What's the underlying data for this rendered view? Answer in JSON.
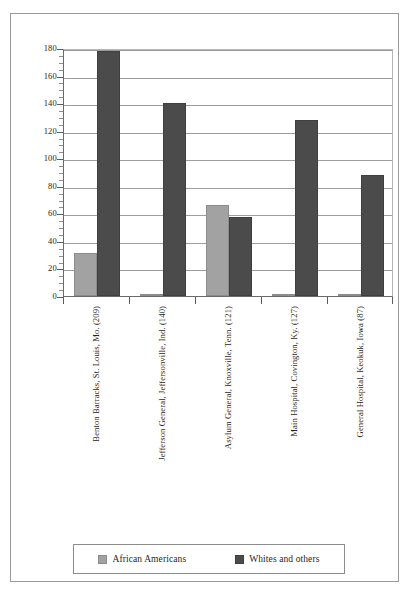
{
  "chart_data": {
    "type": "bar",
    "title": "",
    "subtitle": "",
    "xlabel": "",
    "ylabel": "",
    "ylim": [
      0,
      180
    ],
    "yticks": [
      0,
      20,
      40,
      60,
      80,
      100,
      120,
      140,
      160,
      180
    ],
    "ytick_labels": [
      "0",
      "20",
      "40",
      "60",
      "80",
      "100",
      "120",
      "140",
      "160",
      "180"
    ],
    "minor_tick_step": 5,
    "grid": true,
    "grid_axis": "y",
    "legend_position": "bottom",
    "categories": [
      "Benton Barracks, St. Louis, Mo. (209)",
      "Jefferson General, Jeffersonville, Ind. (140)",
      "Asylum General, Knoxville, Tenn. (121)",
      "Main Hospital, Covington, Ky. (127)",
      "General Hospital, Keokuk, Iowa (87)"
    ],
    "series": [
      {
        "name": "African Americans",
        "color": "#a2a2a2",
        "values": [
          31,
          1,
          66,
          1,
          1
        ]
      },
      {
        "name": "Whites and others",
        "color": "#4b4b4b",
        "values": [
          178,
          140,
          57,
          128,
          88
        ]
      }
    ]
  },
  "legend": {
    "entries": [
      {
        "label": "African Americans",
        "swatch": "light-gray-swatch"
      },
      {
        "label": "Whites and others",
        "swatch": "dark-gray-swatch"
      }
    ]
  }
}
